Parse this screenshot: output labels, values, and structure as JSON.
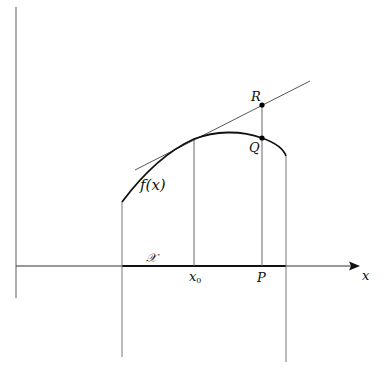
{
  "figure": {
    "labels": {
      "function": "f(x)",
      "point_R": "R",
      "point_Q": "Q",
      "point_P": "P",
      "x0": "x",
      "x0_sub": "0",
      "x_axis": "x",
      "domain": "𝒳"
    },
    "colors": {
      "curve": "#111111",
      "axes": "#333333",
      "thin_lines": "#666666",
      "points": "#000000"
    },
    "geometry": {
      "y_axis": {
        "x": 16,
        "y_top": 7,
        "y_bottom": 298
      },
      "x_axis": {
        "y": 266,
        "x_start": 16,
        "x_end": 360
      },
      "domain_segment": {
        "x_start": 122,
        "x_end": 286
      },
      "left_boundary_x": 122,
      "right_boundary_x": 286,
      "x0_x": 194,
      "P_x": 262,
      "R": [
        262,
        105
      ],
      "Q": [
        262,
        138
      ],
      "tangent": {
        "from": [
          135,
          170
        ],
        "to": [
          310,
          81
        ]
      }
    }
  }
}
